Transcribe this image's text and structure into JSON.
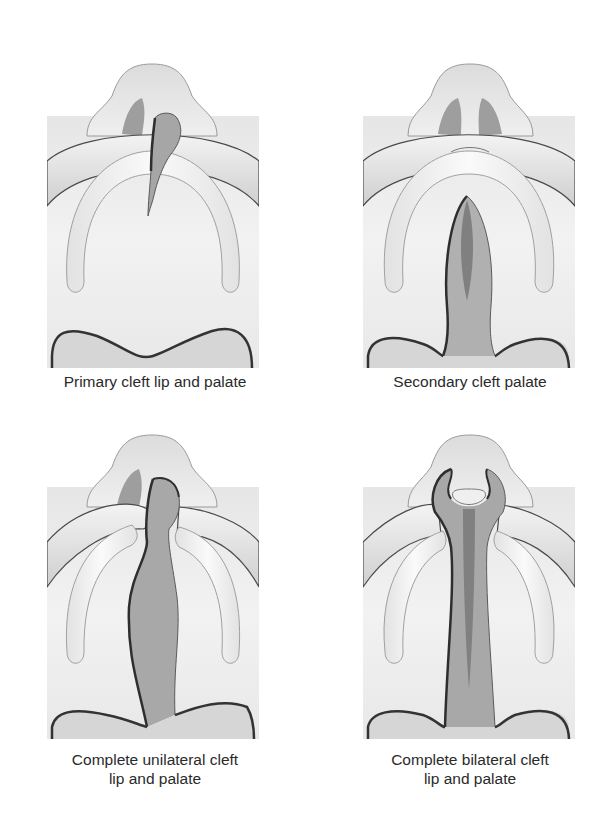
{
  "figure": {
    "panels": [
      {
        "id": "primary",
        "caption": "Primary cleft lip and palate"
      },
      {
        "id": "secondary",
        "caption": "Secondary cleft palate"
      },
      {
        "id": "unilateral",
        "caption": "Complete unilateral cleft\nlip and palate"
      },
      {
        "id": "bilateral",
        "caption": "Complete bilateral cleft\nlip and palate"
      }
    ],
    "colors": {
      "tissue_light": "#ececec",
      "tissue_mid": "#d6d6d6",
      "ridge": "#f4f4f4",
      "cleft_fill": "#a8a8a8",
      "cleft_dark": "#7c7c7c",
      "outline": "#3a3a3a",
      "outline_light": "#9a9a9a"
    }
  }
}
